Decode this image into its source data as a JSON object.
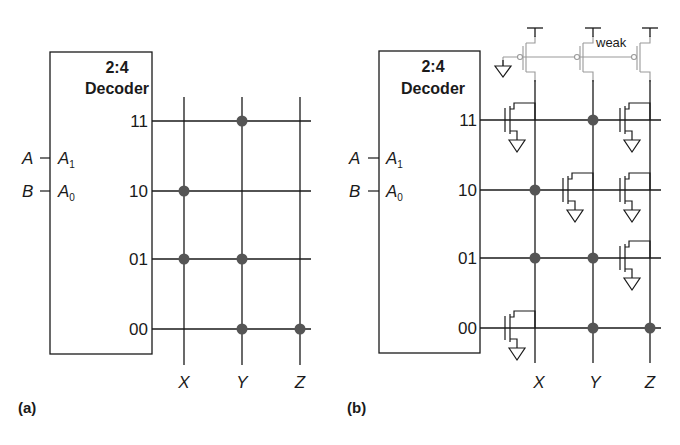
{
  "figure": {
    "panels": [
      {
        "id": "a",
        "label": "(a)",
        "decoder": {
          "title_line1": "2:4",
          "title_line2": "Decoder"
        },
        "inputs": [
          {
            "signal": "A",
            "pin": "A",
            "pin_sub": "1"
          },
          {
            "signal": "B",
            "pin": "A",
            "pin_sub": "0"
          }
        ],
        "rows": [
          "11",
          "10",
          "01",
          "00"
        ],
        "columns": [
          "X",
          "Y",
          "Z"
        ],
        "dots": {
          "11": [
            "Y"
          ],
          "10": [
            "X"
          ],
          "01": [
            "X",
            "Y"
          ],
          "00": [
            "Y",
            "Z"
          ]
        }
      },
      {
        "id": "b",
        "label": "(b)",
        "decoder": {
          "title_line1": "2:4",
          "title_line2": "Decoder"
        },
        "inputs": [
          {
            "signal": "A",
            "pin": "A",
            "pin_sub": "1"
          },
          {
            "signal": "B",
            "pin": "A",
            "pin_sub": "0"
          }
        ],
        "rows": [
          "11",
          "10",
          "01",
          "00"
        ],
        "columns": [
          "X",
          "Y",
          "Z"
        ],
        "pullup_label": "weak",
        "dots": {
          "11": [
            "Y"
          ],
          "10": [
            "X"
          ],
          "01": [
            "X",
            "Y"
          ],
          "00": [
            "Y",
            "Z"
          ]
        },
        "pulldown_transistors": {
          "11": [
            "X",
            "Z"
          ],
          "10": [
            "Y",
            "Z"
          ],
          "01": [
            "Z"
          ],
          "00": [
            "X"
          ]
        }
      }
    ],
    "colors": {
      "line": "#1a1a1a",
      "dot": "#555555",
      "pullup": "#999999"
    }
  }
}
